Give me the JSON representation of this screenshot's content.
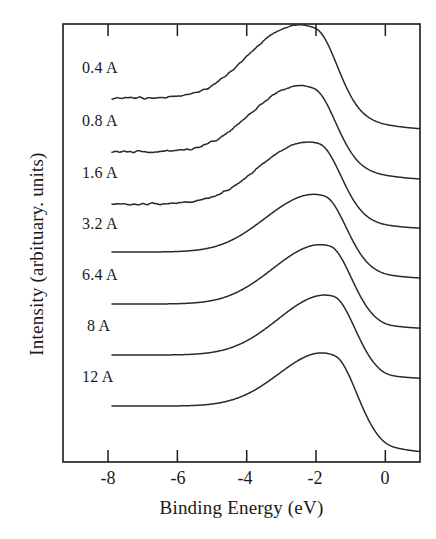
{
  "chart_data": {
    "type": "line",
    "title": "",
    "xlabel": "Binding Energy (eV)",
    "ylabel": "Intensity (arbituary. units)",
    "xlim": [
      -9.3,
      1.0
    ],
    "ylim": [
      0,
      1
    ],
    "grid": false,
    "legend": "inline-left-labels",
    "xticks": [
      -8,
      -6,
      -4,
      -2,
      0
    ],
    "xtick_labels": [
      "-8",
      "-6",
      "-4",
      "-2",
      "0"
    ],
    "yticks": [],
    "ytick_labels": [],
    "note": "Stacked / offset photoemission valence-band spectra; each trace labelled by overlayer thickness in Angstroms. Curves share a common arbitrary intensity scale and are vertically offset.",
    "series": [
      {
        "name": "0.4 A",
        "label": "0.4 A",
        "noisy": true,
        "baseline_left": 0.06,
        "baseline_right": 0.0,
        "peak_x": -2.0,
        "peak_height": 1.0,
        "shoulder_x": -3.6,
        "shoulder_height": 0.26,
        "offset_index": 0
      },
      {
        "name": "0.8 A",
        "label": "0.8 A",
        "noisy": true,
        "baseline_left": 0.05,
        "baseline_right": 0.0,
        "peak_x": -2.05,
        "peak_height": 0.9,
        "shoulder_x": -3.5,
        "shoulder_height": 0.2,
        "offset_index": 1
      },
      {
        "name": "1.6 A",
        "label": "1.6 A",
        "noisy": true,
        "baseline_left": 0.04,
        "baseline_right": 0.0,
        "peak_x": -1.9,
        "peak_height": 0.88,
        "shoulder_x": -3.4,
        "shoulder_height": 0.14,
        "offset_index": 2
      },
      {
        "name": "3.2 A",
        "label": "3.2 A",
        "noisy": false,
        "baseline_left": 0.0,
        "baseline_right": 0.0,
        "peak_x": -1.75,
        "peak_height": 0.86,
        "shoulder_x": -3.3,
        "shoulder_height": 0.1,
        "offset_index": 3
      },
      {
        "name": "6.4 A",
        "label": "6.4 A",
        "noisy": false,
        "baseline_left": 0.0,
        "baseline_right": 0.0,
        "peak_x": -1.6,
        "peak_height": 0.9,
        "shoulder_x": -3.2,
        "shoulder_height": 0.08,
        "offset_index": 4
      },
      {
        "name": "8 A",
        "label": "8 A",
        "noisy": false,
        "baseline_left": 0.0,
        "baseline_right": 0.0,
        "peak_x": -1.5,
        "peak_height": 0.92,
        "shoulder_x": -3.1,
        "shoulder_height": 0.06,
        "offset_index": 5
      },
      {
        "name": "12 A",
        "label": "12 A",
        "noisy": false,
        "baseline_left": 0.0,
        "baseline_right": 0.0,
        "peak_x": -1.45,
        "peak_height": 0.95,
        "shoulder_x": -3.0,
        "shoulder_height": 0.04,
        "offset_index": 6
      }
    ],
    "colors": {
      "line": "#2a2a2a",
      "axis": "#1a1a1a",
      "background": "#ffffff"
    }
  }
}
